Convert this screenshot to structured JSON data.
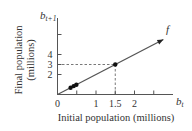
{
  "chart_data": {
    "type": "line",
    "title": "",
    "xlabel": "Initial population (millions)",
    "ylabel_line1": "Final population",
    "ylabel_line2": "(millions)",
    "x_var": "b",
    "x_var_sub": "t",
    "y_var": "b",
    "y_var_sub": "t+1",
    "function_label": "f",
    "xlim": [
      0,
      3
    ],
    "ylim": [
      0,
      7.5
    ],
    "x_ticks": [
      0,
      0.5,
      1,
      1.5,
      2,
      2.5
    ],
    "x_tick_labels": [
      {
        "value": 0,
        "label": "0"
      },
      {
        "value": 1,
        "label": "1"
      },
      {
        "value": 1.5,
        "label": "1.5"
      },
      {
        "value": 2,
        "label": "2"
      }
    ],
    "y_ticks": [
      2,
      3,
      4,
      6
    ],
    "y_tick_labels": [
      {
        "value": 2,
        "label": "2"
      },
      {
        "value": 3,
        "label": "3"
      },
      {
        "value": 4,
        "label": "4"
      }
    ],
    "series": [
      {
        "name": "f",
        "style": "line-arrow",
        "x": [
          0,
          2.75
        ],
        "y": [
          0,
          5.5
        ]
      },
      {
        "name": "data points",
        "style": "scatter",
        "x": [
          0.34,
          0.42,
          0.49,
          1.5
        ],
        "y": [
          0.68,
          0.84,
          0.98,
          3
        ]
      }
    ],
    "annotations": [
      {
        "type": "dashed-guide",
        "x": 1.5,
        "y": 3
      }
    ],
    "grid": false,
    "legend": "none"
  }
}
